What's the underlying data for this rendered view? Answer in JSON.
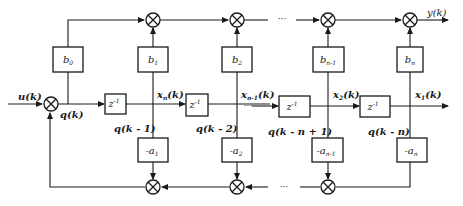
{
  "diagram": {
    "type": "block-diagram",
    "input": {
      "label": "u(k)"
    },
    "output": {
      "label": "y(k)"
    },
    "internal_signal": {
      "label": "q(k)"
    },
    "feedforward_gains": [
      {
        "label": "b",
        "sub": "0"
      },
      {
        "label": "b",
        "sub": "1"
      },
      {
        "label": "b",
        "sub": "2"
      },
      {
        "label": "b",
        "sub": "n-1"
      },
      {
        "label": "b",
        "sub": "n"
      }
    ],
    "feedback_gains": [
      {
        "label": "-a",
        "sub": "1"
      },
      {
        "label": "-a",
        "sub": "2"
      },
      {
        "label": "-a",
        "sub": "n-1"
      },
      {
        "label": "-a",
        "sub": "n"
      }
    ],
    "delays": [
      {
        "label": "z",
        "sup": "-1"
      },
      {
        "label": "z",
        "sup": "-1"
      },
      {
        "label": "z",
        "sup": "-1"
      },
      {
        "label": "z",
        "sup": "-1"
      }
    ],
    "state_labels": [
      {
        "name": "x",
        "sub": "n",
        "arg": "(k)"
      },
      {
        "name": "x",
        "sub": "n-1",
        "arg": "(k)"
      },
      {
        "name": "x",
        "sub": "2",
        "arg": "(k)"
      },
      {
        "name": "x",
        "sub": "1",
        "arg": "(k)"
      }
    ],
    "delay_output_labels": [
      "q(k - 1)",
      "q(k - 2)",
      "q(k - n + 1)",
      "q(k - n)"
    ],
    "ellipsis": "···"
  }
}
